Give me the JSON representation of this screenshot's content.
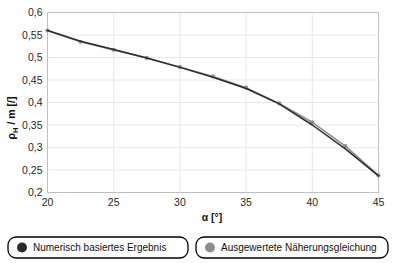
{
  "chart_data": {
    "type": "line",
    "title": "",
    "xlabel": "α [°]",
    "ylabel": "ρH / m [/]",
    "ylabel_main": "ρ",
    "ylabel_sub": "H",
    "ylabel_rest": " / m [/]",
    "xlim": [
      20,
      45
    ],
    "ylim": [
      0.2,
      0.6
    ],
    "xticks": [
      20,
      25,
      30,
      35,
      40,
      45
    ],
    "xtick_labels": [
      "20",
      "25",
      "30",
      "35",
      "40",
      "45"
    ],
    "yticks": [
      0.2,
      0.25,
      0.3,
      0.35,
      0.4,
      0.45,
      0.5,
      0.55,
      0.6
    ],
    "ytick_labels": [
      "0,2",
      "0,25",
      "0,3",
      "0,35",
      "0,4",
      "0,45",
      "0,5",
      "0,55",
      "0,6"
    ],
    "grid": true,
    "legend_position": "bottom",
    "x": [
      20,
      22.5,
      25,
      27.5,
      30,
      32.5,
      35,
      37.5,
      40,
      42.5,
      45
    ],
    "series": [
      {
        "name": "Numerisch basiertes Ergebnis",
        "color": "#2b2b2b",
        "marker": "circle",
        "values": [
          0.56,
          0.536,
          0.518,
          0.499,
          0.478,
          0.456,
          0.431,
          0.397,
          0.35,
          0.297,
          0.237
        ]
      },
      {
        "name": "Ausgewertete Näherungsgleichung",
        "color": "#8d8d8d",
        "marker": "circle",
        "values": [
          0.56,
          0.535,
          0.517,
          0.499,
          0.479,
          0.458,
          0.433,
          0.398,
          0.356,
          0.303,
          0.238
        ]
      }
    ]
  },
  "legend": {
    "items": [
      {
        "label": "Numerisch basiertes Ergebnis",
        "color": "#2b2b2b"
      },
      {
        "label": "Ausgewertete Näherungsgleichung",
        "color": "#8d8d8d"
      }
    ]
  },
  "colors": {
    "series_dark": "#2b2b2b",
    "series_light": "#8d8d8d",
    "grid": "#e2e2e6",
    "frame": "#b9b9bf",
    "text": "#1f1f1f",
    "background": "#ffffff"
  }
}
